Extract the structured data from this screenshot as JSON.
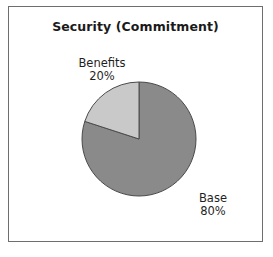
{
  "chart": {
    "title": "Security (Commitment)",
    "frame_border_color": "#6e6e6e",
    "background_color": "#ffffff",
    "text_color": "#1f1f1f"
  },
  "chart_data": {
    "type": "pie",
    "title": "Security (Commitment)",
    "xlabel": "",
    "ylabel": "",
    "legend": "none",
    "grid": false,
    "start_angle_deg": 0,
    "direction": "clockwise",
    "units": "percent",
    "categories": [
      "Base",
      "Benefits"
    ],
    "values": [
      80,
      20
    ],
    "slices": [
      {
        "label": "Base",
        "value": 80,
        "value_text": "80%",
        "color": "#8a8a8a",
        "stroke": "#4a4a4a",
        "start_deg": 0,
        "end_deg": 288,
        "label_position": "outside-right-bottom"
      },
      {
        "label": "Benefits",
        "value": 20,
        "value_text": "20%",
        "color": "#c9c9c9",
        "stroke": "#4a4a4a",
        "start_deg": 288,
        "end_deg": 360,
        "label_position": "outside-left-top"
      }
    ],
    "geometry": {
      "center_x": 130,
      "center_y": 132,
      "radius": 57
    }
  },
  "labels": {
    "benefits": {
      "name": "Benefits",
      "percent": "20%"
    },
    "base": {
      "name": "Base",
      "percent": "80%"
    }
  }
}
